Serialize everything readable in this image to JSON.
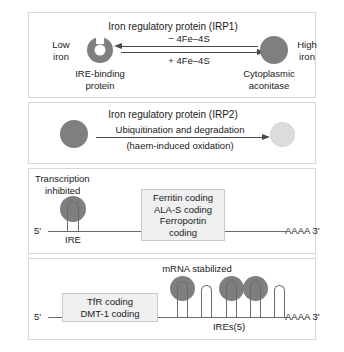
{
  "panel_irp1": {
    "heading": "Iron regulatory protein (IRP1)",
    "left_state_line1": "Low",
    "left_state_line2": "iron",
    "left_name_line1": "IRE-binding",
    "left_name_line2": "protein",
    "right_state_line1": "High",
    "right_state_line2": "iron",
    "right_name_line1": "Cytoplasmic",
    "right_name_line2": "aconitase",
    "arrow_top_label": "− 4Fe–4S",
    "arrow_bottom_label": "+ 4Fe–4S",
    "icon_left": "ire-binding-protein-ring",
    "icon_right": "cytoplasmic-aconitase-circle"
  },
  "panel_irp2": {
    "heading": "Iron regulatory protein (IRP2)",
    "arrow_label_top": "Ubiquitination and degradation",
    "arrow_label_bottom": "(haem-induced oxidation)",
    "icon_left": "irp2-intact-circle",
    "icon_right": "irp2-degraded-circle"
  },
  "panel_ferritin": {
    "status_line1": "Transcription",
    "status_line2": "inhibited",
    "five_prime": "5'",
    "three_prime": "AAAA  3'",
    "ire_label": "IRE",
    "coding_lines": [
      "Ferritin coding",
      "ALA-S coding",
      "Ferroportin coding"
    ]
  },
  "panel_tfr": {
    "status": "mRNA stabilized",
    "five_prime": "5'",
    "three_prime": "AAAA  3'",
    "ires_label": "IREs(5)",
    "coding_lines": [
      "TfR coding",
      "DMT-1 coding"
    ],
    "stem_loops_bound": [
      true,
      false,
      true,
      true,
      false
    ],
    "stem_loop_count": 5
  },
  "colors": {
    "protein_gray": "#7f7f7f",
    "degraded_gray": "#dcdcdc",
    "line_gray": "#4a4a4a",
    "rna_gray": "#6a6a6a",
    "box_fill": "#f0f0f0",
    "box_border": "#c9c9c9",
    "panel_border": "#d8d8d8",
    "text": "#1a1a1a"
  }
}
